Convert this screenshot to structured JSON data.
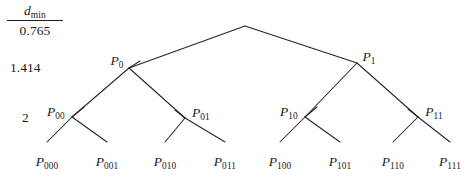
{
  "figure": {
    "type": "binary-partition-tree",
    "background": "#ffffff",
    "line_color": "#242424"
  },
  "axis": {
    "header_numerator": "d",
    "header_numerator_sub": "min",
    "header_denominator": "0.765",
    "level_labels": [
      {
        "text": "1.414",
        "x": 10,
        "y": 68
      },
      {
        "text": "2",
        "x": 22,
        "y": 118
      }
    ]
  },
  "nodes": {
    "root": {
      "label": "",
      "sub": "",
      "x": 245,
      "y": 26
    },
    "level1": [
      {
        "label": "P",
        "sub": "0",
        "x": 129,
        "y": 68,
        "label_x": 117,
        "label_y": 61
      },
      {
        "label": "P",
        "sub": "1",
        "x": 357,
        "y": 63,
        "label_x": 369,
        "label_y": 57
      }
    ],
    "level2": [
      {
        "label": "P",
        "sub": "00",
        "x": 72,
        "y": 117,
        "label_x": 56,
        "label_y": 112
      },
      {
        "label": "P",
        "sub": "01",
        "x": 185,
        "y": 118,
        "label_x": 201,
        "label_y": 113
      },
      {
        "label": "P",
        "sub": "10",
        "x": 305,
        "y": 117,
        "label_x": 289,
        "label_y": 112
      },
      {
        "label": "P",
        "sub": "11",
        "x": 418,
        "y": 117,
        "label_x": 434,
        "label_y": 112
      }
    ],
    "leaves": [
      {
        "label": "P",
        "sub": "000",
        "x": 47,
        "y": 140,
        "label_x": 47,
        "label_y": 155
      },
      {
        "label": "P",
        "sub": "001",
        "x": 107,
        "y": 140,
        "label_x": 107,
        "label_y": 155
      },
      {
        "label": "P",
        "sub": "010",
        "x": 165,
        "y": 140,
        "label_x": 165,
        "label_y": 155
      },
      {
        "label": "P",
        "sub": "011",
        "x": 225,
        "y": 140,
        "label_x": 225,
        "label_y": 155
      },
      {
        "label": "P",
        "sub": "100",
        "x": 280,
        "y": 140,
        "label_x": 280,
        "label_y": 155
      },
      {
        "label": "P",
        "sub": "101",
        "x": 340,
        "y": 140,
        "label_x": 340,
        "label_y": 155
      },
      {
        "label": "P",
        "sub": "110",
        "x": 393,
        "y": 140,
        "label_x": 393,
        "label_y": 155
      },
      {
        "label": "P",
        "sub": "111",
        "x": 450,
        "y": 140,
        "label_x": 450,
        "label_y": 155
      }
    ]
  },
  "edges": [
    {
      "from": "root",
      "to": "P0",
      "x1": 245,
      "y1": 26,
      "x2": 129,
      "y2": 68
    },
    {
      "from": "root",
      "to": "P1",
      "x1": 245,
      "y1": 26,
      "x2": 357,
      "y2": 63
    },
    {
      "from": "P0",
      "to": "P00",
      "x1": 129,
      "y1": 68,
      "x2": 72,
      "y2": 117
    },
    {
      "from": "P0",
      "to": "P01",
      "x1": 129,
      "y1": 68,
      "x2": 185,
      "y2": 118
    },
    {
      "from": "P1",
      "to": "P10",
      "x1": 357,
      "y1": 63,
      "x2": 305,
      "y2": 117
    },
    {
      "from": "P1",
      "to": "P11",
      "x1": 357,
      "y1": 63,
      "x2": 418,
      "y2": 117
    },
    {
      "from": "P00",
      "to": "P000",
      "x1": 72,
      "y1": 117,
      "x2": 47,
      "y2": 142
    },
    {
      "from": "P00",
      "to": "P001",
      "x1": 72,
      "y1": 117,
      "x2": 107,
      "y2": 142
    },
    {
      "from": "P01",
      "to": "P010",
      "x1": 185,
      "y1": 118,
      "x2": 165,
      "y2": 142
    },
    {
      "from": "P01",
      "to": "P011",
      "x1": 185,
      "y1": 118,
      "x2": 225,
      "y2": 142
    },
    {
      "from": "P10",
      "to": "P100",
      "x1": 305,
      "y1": 117,
      "x2": 280,
      "y2": 142
    },
    {
      "from": "P10",
      "to": "P101",
      "x1": 305,
      "y1": 117,
      "x2": 340,
      "y2": 142
    },
    {
      "from": "P11",
      "to": "P110",
      "x1": 418,
      "y1": 117,
      "x2": 393,
      "y2": 142
    },
    {
      "from": "P11",
      "to": "P111",
      "x1": 418,
      "y1": 117,
      "x2": 450,
      "y2": 142
    }
  ],
  "edge_overshoot": [
    {
      "x1": 129,
      "y1": 68,
      "x2": 140,
      "y2": 61
    },
    {
      "x1": 72,
      "y1": 117,
      "x2": 84,
      "y2": 107
    },
    {
      "x1": 185,
      "y1": 118,
      "x2": 175,
      "y2": 110
    },
    {
      "x1": 305,
      "y1": 117,
      "x2": 317,
      "y2": 107
    },
    {
      "x1": 418,
      "y1": 117,
      "x2": 408,
      "y2": 109
    }
  ]
}
